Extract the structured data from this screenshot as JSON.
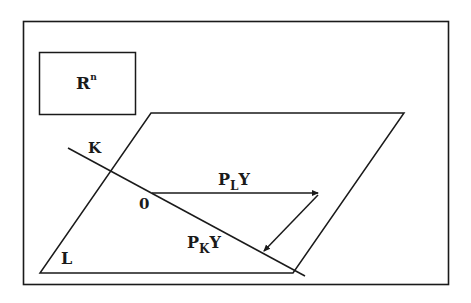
{
  "diagram": {
    "space_label": {
      "base": "R",
      "superscript": "n"
    },
    "line_label": "K",
    "plane_label": "L",
    "origin_label": "0",
    "projection_L": {
      "base": "P",
      "subscript": "L",
      "suffix": "Y"
    },
    "projection_K": {
      "base": "P",
      "subscript": "K",
      "suffix": "Y"
    }
  },
  "colors": {
    "stroke": "#1a1a1a",
    "background": "#ffffff"
  }
}
